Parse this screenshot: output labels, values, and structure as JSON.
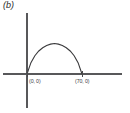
{
  "figure": {
    "panel_label": "(b)",
    "background_color": "#ffffff",
    "axis_color": "#58585a",
    "curve_color": "#3a3a3c",
    "label_color": "#3a3a3c"
  },
  "axes": {
    "x_axis": {
      "from_x": 3,
      "to_x": 122,
      "y": 74
    },
    "y_axis": {
      "x": 27,
      "from_y": 13,
      "to_y": 108
    },
    "origin_px": {
      "x": 27,
      "y": 74
    },
    "x_scale_px_per_unit": 0.7857
  },
  "points": [
    {
      "name": "origin-point",
      "label": "(0, 0)",
      "x": 0,
      "y": 0,
      "px_x": 27,
      "px_y": 74,
      "label_px_x": 29,
      "label_px_y": 83
    },
    {
      "name": "right-root-point",
      "label": "(70, 0)",
      "x": 70,
      "y": 0,
      "px_x": 82,
      "px_y": 74,
      "label_px_x": 75,
      "label_px_y": 83
    }
  ],
  "chart_data": {
    "type": "line",
    "title": "(b)",
    "xlabel": "",
    "ylabel": "",
    "annotations": [
      "(0, 0)",
      "(70, 0)"
    ],
    "grid": false,
    "legend": "none",
    "xlim": [
      -30,
      121
    ],
    "ylim": [
      -43,
      78
    ],
    "roots": [
      0,
      70
    ],
    "apex": {
      "x": 35,
      "y": 39
    },
    "series": [
      {
        "name": "arc",
        "x": [
          0,
          5,
          10,
          15,
          20,
          25,
          30,
          35,
          40,
          45,
          50,
          55,
          60,
          65,
          70
        ],
        "y": [
          0,
          14.5,
          23.4,
          29.4,
          33.5,
          36.4,
          38.2,
          39.0,
          38.2,
          36.4,
          33.5,
          29.4,
          23.4,
          14.5,
          0
        ]
      }
    ]
  }
}
